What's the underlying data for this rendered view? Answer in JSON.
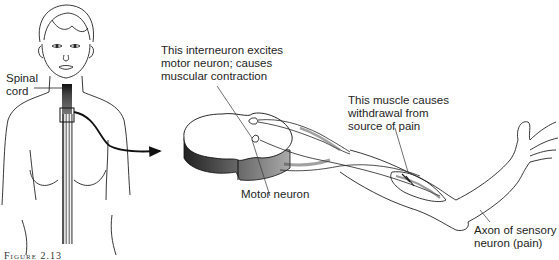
{
  "figure": {
    "caption": "Figure 2.13"
  },
  "labels": {
    "spinal_cord": [
      "Spinal",
      "cord"
    ],
    "interneuron": [
      "This interneuron excites",
      "motor neuron; causes",
      "muscular contraction"
    ],
    "muscle": [
      "This muscle causes",
      "withdrawal from",
      "source of pain"
    ],
    "motor_neuron": [
      "Motor neuron"
    ],
    "sensory_axon": [
      "Axon of sensory",
      "neuron (pain)"
    ]
  },
  "colors": {
    "ink": "#1e1e1e",
    "shade": "#555555",
    "background": "#ffffff"
  }
}
